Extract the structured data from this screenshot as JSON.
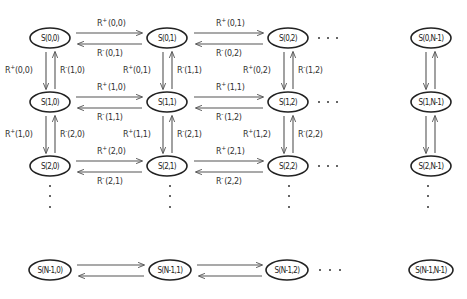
{
  "diagram": {
    "nodes": {
      "r0c0": "S(0,0)",
      "r0c1": "S(0,1)",
      "r0c2": "S(0,2)",
      "r0cN": "S(0,N-1)",
      "r1c0": "S(1,0)",
      "r1c1": "S(1,1)",
      "r1c2": "S(1,2)",
      "r1cN": "S(1,N-1)",
      "r2c0": "S(2,0)",
      "r2c1": "S(2,1)",
      "r2c2": "S(2,2)",
      "r2cN": "S(2,N-1)",
      "rNc0": "S(N-1,0)",
      "rNc1": "S(N-1,1)",
      "rNc2": "S(N-1,2)",
      "rNcN": "S(N-1,N-1)"
    },
    "horizontal_labels": {
      "r0_01_fwd": "(0,0)",
      "r0_01_bwd": "(0,1)",
      "r0_12_fwd": "(0,1)",
      "r0_12_bwd": "(0,2)",
      "r1_01_fwd": "(1,0)",
      "r1_01_bwd": "(1,1)",
      "r1_12_fwd": "(1,1)",
      "r1_12_bwd": "(1,2)",
      "r2_01_fwd": "(2,0)",
      "r2_01_bwd": "(2,1)",
      "r2_12_fwd": "(2,1)",
      "r2_12_bwd": "(2,2)"
    },
    "vertical_labels": {
      "c0_01_down": "(0,0)",
      "c0_01_up": "(1,0)",
      "c1_01_down": "(0,1)",
      "c1_01_up": "(1,1)",
      "c2_01_down": "(0,2)",
      "c2_01_up": "(1,2)",
      "c0_12_down": "(1,0)",
      "c0_12_up": "(2,0)",
      "c1_12_down": "(1,1)",
      "c1_12_up": "(2,1)",
      "c2_12_down": "(1,2)",
      "c2_12_up": "(2,2)"
    },
    "symbols": {
      "horizontal_rate": "R",
      "horizontal_sub": "I",
      "vertical_rate": "R",
      "vertical_sub": "D",
      "plus": "+",
      "minus": "-",
      "ellipsis": "· · ·"
    },
    "colors": {
      "stroke": "#222222",
      "arrow": "#555555",
      "text": "#333333"
    }
  }
}
